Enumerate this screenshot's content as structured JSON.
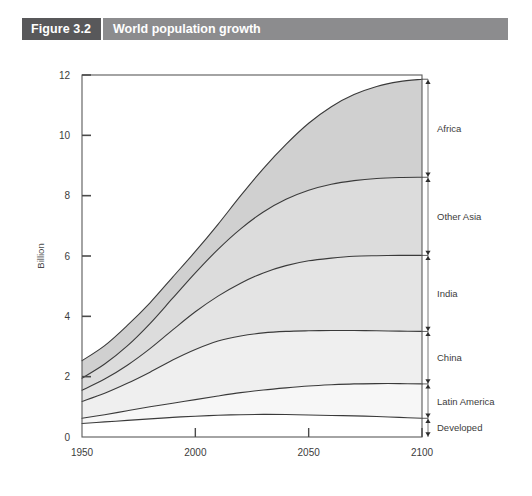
{
  "header": {
    "tag": "Figure 3.2",
    "title": "World population growth"
  },
  "chart_data": {
    "type": "area",
    "title": "World population growth",
    "xlabel": "",
    "ylabel": "Billion",
    "xlim": [
      1950,
      2100
    ],
    "ylim": [
      0,
      12
    ],
    "xticks": [
      1950,
      2000,
      2050,
      2100
    ],
    "xticklabels": [
      "1950",
      "2000",
      "2050",
      "2100"
    ],
    "yticks": [
      0,
      2,
      4,
      6,
      8,
      10,
      12
    ],
    "yticklabels": [
      "0",
      "2",
      "4",
      "6",
      "8",
      "10",
      "12"
    ],
    "grid": false,
    "legend_position": "right-outside",
    "stacked": true,
    "x": [
      1950,
      1960,
      1970,
      1980,
      1990,
      2000,
      2010,
      2020,
      2030,
      2040,
      2050,
      2060,
      2070,
      2080,
      2090,
      2100
    ],
    "series": [
      {
        "name": "Developed",
        "label": "Developed",
        "color": "#ffffff",
        "cumulative_values": [
          0.45,
          0.5,
          0.55,
          0.6,
          0.65,
          0.69,
          0.72,
          0.74,
          0.75,
          0.745,
          0.73,
          0.715,
          0.7,
          0.68,
          0.65,
          0.62
        ]
      },
      {
        "name": "Latin America",
        "label": "Latin America",
        "color": "#f7f7f7",
        "cumulative_values": [
          0.62,
          0.74,
          0.87,
          1.0,
          1.12,
          1.24,
          1.36,
          1.47,
          1.56,
          1.63,
          1.69,
          1.73,
          1.76,
          1.77,
          1.77,
          1.76
        ]
      },
      {
        "name": "China",
        "label": "China",
        "color": "#efefef",
        "cumulative_values": [
          1.18,
          1.45,
          1.78,
          2.15,
          2.55,
          2.9,
          3.18,
          3.35,
          3.45,
          3.5,
          3.52,
          3.53,
          3.53,
          3.52,
          3.51,
          3.5
        ]
      },
      {
        "name": "India",
        "label": "India",
        "color": "#e4e4e4",
        "cumulative_values": [
          1.55,
          1.92,
          2.38,
          2.93,
          3.55,
          4.15,
          4.67,
          5.1,
          5.44,
          5.68,
          5.84,
          5.93,
          5.99,
          6.01,
          6.02,
          6.02
        ]
      },
      {
        "name": "Other Asia",
        "label": "Other Asia",
        "color": "#dcdcdc",
        "cumulative_values": [
          1.95,
          2.42,
          3.02,
          3.76,
          4.6,
          5.44,
          6.22,
          6.9,
          7.46,
          7.88,
          8.18,
          8.38,
          8.5,
          8.57,
          8.6,
          8.61
        ]
      },
      {
        "name": "Africa",
        "label": "Africa",
        "color": "#d0d0d0",
        "cumulative_values": [
          2.53,
          3.03,
          3.7,
          4.45,
          5.3,
          6.15,
          7.05,
          8.0,
          8.9,
          9.7,
          10.4,
          10.95,
          11.35,
          11.62,
          11.78,
          11.86
        ]
      }
    ],
    "series_end_brackets": [
      {
        "label": "Africa",
        "top": 11.86,
        "bottom": 8.61
      },
      {
        "label": "Other Asia",
        "top": 8.61,
        "bottom": 6.02
      },
      {
        "label": "India",
        "top": 6.02,
        "bottom": 3.5
      },
      {
        "label": "China",
        "top": 3.5,
        "bottom": 1.76
      },
      {
        "label": "Latin America",
        "top": 1.76,
        "bottom": 0.62
      },
      {
        "label": "Developed",
        "top": 0.62,
        "bottom": 0.0
      }
    ]
  }
}
